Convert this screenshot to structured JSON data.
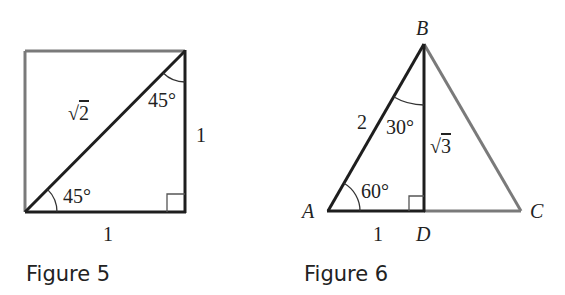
{
  "figures": [
    {
      "caption": "Figure 5",
      "shape": "square with diagonal",
      "labels": {
        "diagonal": "2",
        "diagonal_prefix": "√",
        "angle_top": "45°",
        "angle_bottom": "45°",
        "side_right": "1",
        "side_bottom": "1"
      }
    },
    {
      "caption": "Figure 6",
      "shape": "equilateral triangle with altitude",
      "vertices": {
        "A": "A",
        "B": "B",
        "C": "C",
        "D": "D"
      },
      "labels": {
        "side_AB": "2",
        "angle_B": "30°",
        "angle_A": "60°",
        "altitude": "3",
        "altitude_prefix": "√",
        "side_AD": "1"
      }
    }
  ],
  "colors": {
    "dark_line": "#1e1e1e",
    "gray_line": "#7a7a7a",
    "text": "#222222"
  }
}
